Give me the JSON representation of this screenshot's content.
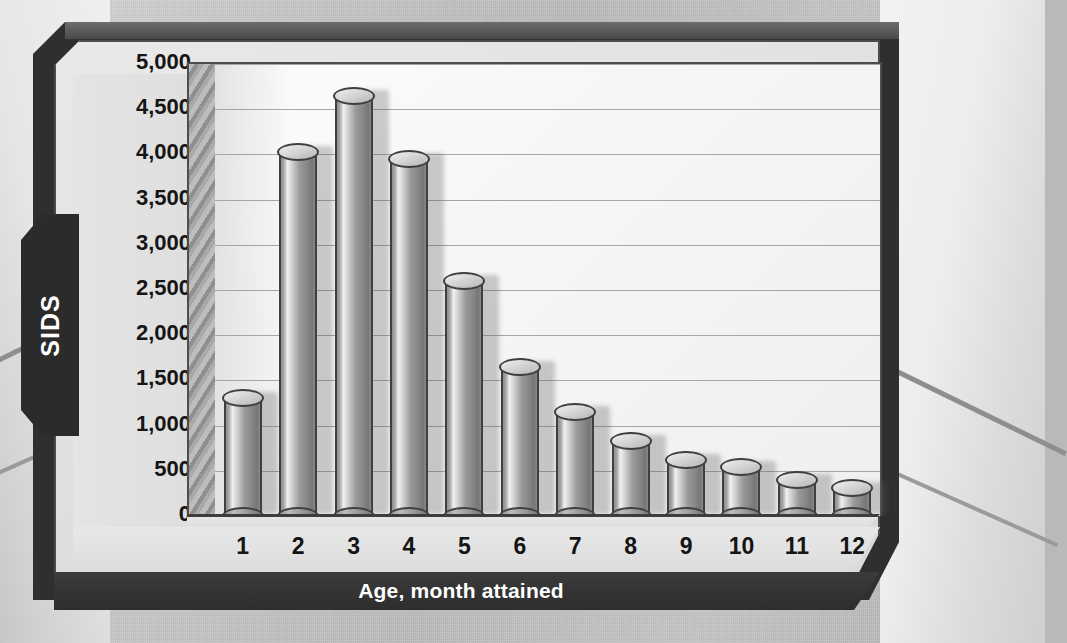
{
  "chart_data": {
    "type": "bar",
    "title": "",
    "xlabel": "Age, month attained",
    "ylabel": "SIDS",
    "categories": [
      "1",
      "2",
      "3",
      "4",
      "5",
      "6",
      "7",
      "8",
      "9",
      "10",
      "11",
      "12"
    ],
    "values": [
      1300,
      4030,
      4650,
      3950,
      2600,
      1650,
      1150,
      830,
      620,
      540,
      400,
      310
    ],
    "ylim": [
      0,
      5000
    ],
    "ytick_labels": [
      "5,000",
      "4,500",
      "4,000",
      "3,500",
      "3,000",
      "2,500",
      "2,000",
      "1,500",
      "1,000",
      "500",
      "0"
    ],
    "ytick_values": [
      5000,
      4500,
      4000,
      3500,
      3000,
      2500,
      2000,
      1500,
      1000,
      500,
      0
    ],
    "grid": true,
    "legend": "none",
    "style": "3d-cylinder-bars",
    "colors": {
      "bar_fill": "#9a9a9a",
      "bar_outline": "#3f3f3f",
      "plot_background": "#f7f7f7",
      "frame_dark": "#2f2f2f",
      "panel_light": "#e4e4e4",
      "axis_title_text": "#ffffff"
    }
  }
}
